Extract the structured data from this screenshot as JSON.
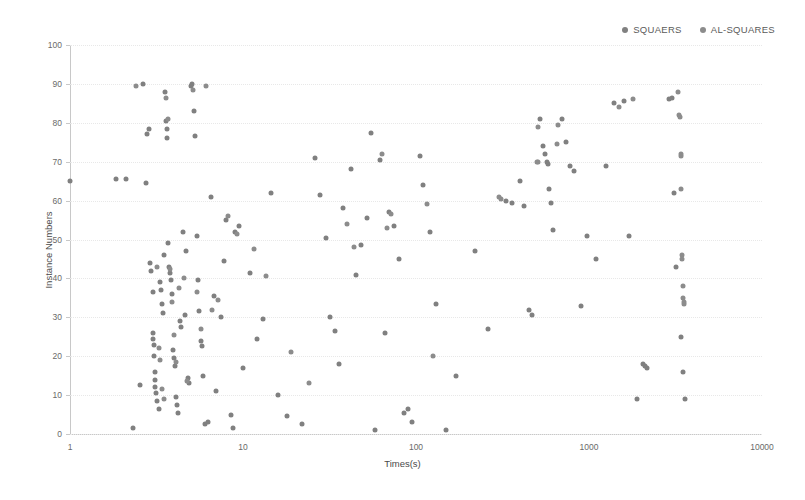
{
  "chart_data": {
    "type": "scatter",
    "title": "",
    "xlabel": "Times(s)",
    "ylabel": "Instance Numbers",
    "xscale": "log",
    "yscale": "linear",
    "xlim": [
      1,
      10000
    ],
    "ylim": [
      0,
      100
    ],
    "xticks": [
      1,
      10,
      100,
      1000,
      10000
    ],
    "xtick_labels": [
      "1",
      "10",
      "100",
      "1000",
      "10000"
    ],
    "yticks": [
      0,
      10,
      20,
      30,
      40,
      50,
      60,
      70,
      80,
      90,
      100
    ],
    "ytick_labels": [
      "0",
      "10",
      "20",
      "30",
      "40",
      "50",
      "60",
      "70",
      "80",
      "90",
      "100"
    ],
    "grid": true,
    "grid_axis": "y",
    "legend_position": "top-right",
    "marker_color": "#808080",
    "marker_size": 5,
    "series": [
      {
        "name": "SQUAERS",
        "color": "#808080",
        "points": [
          [
            1.0,
            65
          ],
          [
            1.85,
            65.5
          ],
          [
            2.1,
            65.5
          ],
          [
            2.3,
            1.5
          ],
          [
            2.55,
            12.5
          ],
          [
            2.65,
            90
          ],
          [
            2.75,
            64.5
          ],
          [
            2.8,
            77
          ],
          [
            2.85,
            78.5
          ],
          [
            2.9,
            44
          ],
          [
            2.95,
            42
          ],
          [
            3.0,
            36.5
          ],
          [
            3.0,
            26
          ],
          [
            3.02,
            24.5
          ],
          [
            3.05,
            23
          ],
          [
            3.05,
            20
          ],
          [
            3.1,
            16
          ],
          [
            3.1,
            14
          ],
          [
            3.12,
            12
          ],
          [
            3.15,
            10.5
          ],
          [
            3.2,
            8.5
          ],
          [
            3.25,
            6.5
          ],
          [
            3.3,
            39
          ],
          [
            3.35,
            37
          ],
          [
            3.4,
            33.5
          ],
          [
            3.45,
            31
          ],
          [
            3.5,
            46
          ],
          [
            3.55,
            88
          ],
          [
            3.6,
            80.5
          ],
          [
            3.62,
            78.5
          ],
          [
            3.65,
            76
          ],
          [
            3.7,
            49
          ],
          [
            3.75,
            43
          ],
          [
            3.8,
            41.5
          ],
          [
            3.85,
            39.5
          ],
          [
            3.9,
            36
          ],
          [
            3.95,
            21.5
          ],
          [
            4.0,
            19.5
          ],
          [
            4.05,
            17.5
          ],
          [
            4.1,
            9.5
          ],
          [
            4.15,
            7.5
          ],
          [
            4.2,
            5.5
          ],
          [
            4.3,
            29
          ],
          [
            4.4,
            27.5
          ],
          [
            4.5,
            52
          ],
          [
            4.6,
            30.5
          ],
          [
            4.7,
            47
          ],
          [
            4.8,
            14.5
          ],
          [
            4.9,
            13
          ],
          [
            5.0,
            89.5
          ],
          [
            5.1,
            90
          ],
          [
            5.2,
            83
          ],
          [
            5.3,
            76.5
          ],
          [
            5.4,
            51
          ],
          [
            5.5,
            39.5
          ],
          [
            5.6,
            31.5
          ],
          [
            5.7,
            24
          ],
          [
            5.8,
            22.5
          ],
          [
            5.9,
            15
          ],
          [
            6.0,
            2.5
          ],
          [
            6.3,
            3
          ],
          [
            6.5,
            61
          ],
          [
            6.8,
            35.5
          ],
          [
            7.0,
            11
          ],
          [
            7.5,
            30
          ],
          [
            7.8,
            44.5
          ],
          [
            8.0,
            55
          ],
          [
            8.5,
            5
          ],
          [
            8.8,
            1.5
          ],
          [
            9.0,
            52
          ],
          [
            9.5,
            53.5
          ],
          [
            10.0,
            17
          ],
          [
            11.0,
            41.5
          ],
          [
            12.0,
            24.5
          ],
          [
            13.0,
            29.5
          ],
          [
            14.5,
            62
          ],
          [
            16.0,
            10
          ],
          [
            18.0,
            4.5
          ],
          [
            22.0,
            2.5
          ],
          [
            26.0,
            71
          ],
          [
            28.0,
            61.5
          ],
          [
            30.0,
            50.5
          ],
          [
            32.0,
            30
          ],
          [
            34.0,
            26.5
          ],
          [
            36.0,
            18
          ],
          [
            38.0,
            58
          ],
          [
            42.0,
            68
          ],
          [
            45.0,
            41
          ],
          [
            48.0,
            48.5
          ],
          [
            52.0,
            55.5
          ],
          [
            55.0,
            77.5
          ],
          [
            58.0,
            1
          ],
          [
            62.0,
            70.5
          ],
          [
            66.0,
            26
          ],
          [
            70.0,
            57
          ],
          [
            75.0,
            53.5
          ],
          [
            80.0,
            45
          ],
          [
            85.0,
            5.5
          ],
          [
            90.0,
            6.5
          ],
          [
            95.0,
            3
          ],
          [
            105.0,
            71.5
          ],
          [
            110.0,
            64
          ],
          [
            120.0,
            52
          ],
          [
            130.0,
            33.5
          ],
          [
            150.0,
            1
          ],
          [
            170.0,
            15
          ],
          [
            220.0,
            47
          ],
          [
            260.0,
            27
          ],
          [
            330.0,
            60
          ],
          [
            360.0,
            59.5
          ],
          [
            400.0,
            65
          ],
          [
            420.0,
            58.5
          ],
          [
            450.0,
            32
          ],
          [
            470.0,
            30.5
          ],
          [
            520.0,
            81
          ],
          [
            540.0,
            74
          ],
          [
            560.0,
            72
          ],
          [
            570.0,
            70
          ],
          [
            580.0,
            69.5
          ],
          [
            590.0,
            63
          ],
          [
            600.0,
            59.5
          ],
          [
            620.0,
            52.5
          ],
          [
            700.0,
            81
          ],
          [
            740.0,
            75
          ],
          [
            780.0,
            69
          ],
          [
            820.0,
            67.5
          ],
          [
            900.0,
            33
          ],
          [
            980.0,
            51
          ],
          [
            1100.0,
            45
          ],
          [
            1250.0,
            69
          ],
          [
            1400.0,
            85
          ],
          [
            1600.0,
            85.5
          ],
          [
            1700.0,
            51
          ],
          [
            1900.0,
            9
          ],
          [
            2050.0,
            18
          ],
          [
            2100.0,
            17.5
          ],
          [
            2150.0,
            17
          ],
          [
            2900.0,
            86
          ],
          [
            3000.0,
            86.5
          ],
          [
            3100.0,
            62
          ],
          [
            3200.0,
            43
          ],
          [
            3400.0,
            25
          ],
          [
            3500.0,
            16
          ],
          [
            3600.0,
            9
          ]
        ]
      },
      {
        "name": "AL-SQUARES",
        "color": "#8c8c8c",
        "points": [
          [
            2.4,
            89.5
          ],
          [
            3.18,
            43
          ],
          [
            3.28,
            22
          ],
          [
            3.33,
            19
          ],
          [
            3.42,
            11.5
          ],
          [
            3.48,
            9
          ],
          [
            3.58,
            86.5
          ],
          [
            3.68,
            81
          ],
          [
            3.78,
            42.5
          ],
          [
            3.88,
            34
          ],
          [
            3.98,
            25.5
          ],
          [
            4.08,
            18.5
          ],
          [
            4.25,
            37.5
          ],
          [
            4.55,
            40
          ],
          [
            4.75,
            13.5
          ],
          [
            5.15,
            88.5
          ],
          [
            5.45,
            36.5
          ],
          [
            5.75,
            27
          ],
          [
            6.1,
            89.5
          ],
          [
            6.6,
            32
          ],
          [
            7.2,
            34.5
          ],
          [
            8.2,
            56
          ],
          [
            9.2,
            51.5
          ],
          [
            11.5,
            47.5
          ],
          [
            13.5,
            40.5
          ],
          [
            19.0,
            21
          ],
          [
            24.0,
            13
          ],
          [
            40.0,
            54
          ],
          [
            44.0,
            48
          ],
          [
            64.0,
            72
          ],
          [
            68.0,
            53
          ],
          [
            72.0,
            56.5
          ],
          [
            115.0,
            59
          ],
          [
            125.0,
            20
          ],
          [
            300.0,
            61
          ],
          [
            310.0,
            60.5
          ],
          [
            500.0,
            70
          ],
          [
            505.0,
            70
          ],
          [
            510.0,
            79
          ],
          [
            650.0,
            74.5
          ],
          [
            660.0,
            79.5
          ],
          [
            1500.0,
            84
          ],
          [
            1800.0,
            86
          ],
          [
            3250.0,
            88
          ],
          [
            3300.0,
            82
          ],
          [
            3350.0,
            81.5
          ],
          [
            3380.0,
            72
          ],
          [
            3390.0,
            71.5
          ],
          [
            3420.0,
            63
          ],
          [
            3450.0,
            46
          ],
          [
            3460.0,
            45
          ],
          [
            3480.0,
            38
          ],
          [
            3500.0,
            35
          ],
          [
            3520.0,
            34
          ],
          [
            3540.0,
            33.5
          ]
        ]
      }
    ]
  },
  "legend": {
    "items": [
      {
        "label": "SQUAERS",
        "color": "#808080"
      },
      {
        "label": "AL-SQUARES",
        "color": "#8c8c8c"
      }
    ]
  },
  "axes": {
    "y_title": "Instance Numbers",
    "x_title": "Times(s)"
  }
}
